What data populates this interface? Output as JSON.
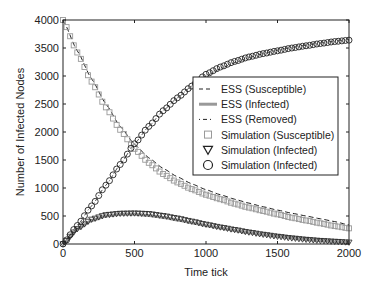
{
  "chart_data": {
    "type": "line",
    "title": "",
    "xlabel": "Time tick",
    "ylabel": "Number of Infected Nodes",
    "xlim": [
      0,
      2000
    ],
    "ylim": [
      0,
      4000
    ],
    "xticks": [
      0,
      500,
      1000,
      1500,
      2000
    ],
    "yticks": [
      0,
      500,
      1000,
      1500,
      2000,
      2500,
      3000,
      3500,
      4000
    ],
    "grid": false,
    "legend_position": "center-right",
    "x": [
      0,
      100,
      200,
      300,
      400,
      500,
      600,
      700,
      800,
      900,
      1000,
      1100,
      1200,
      1300,
      1400,
      1500,
      1600,
      1700,
      1800,
      1900,
      2000
    ],
    "series": [
      {
        "name": "ESS (Susceptible)",
        "style": "dashed",
        "color": "#222222",
        "values": [
          4000,
          3450,
          2950,
          2500,
          2100,
          1780,
          1540,
          1350,
          1200,
          1075,
          970,
          880,
          800,
          730,
          665,
          605,
          550,
          500,
          450,
          400,
          340
        ]
      },
      {
        "name": "ESS (Infected)",
        "style": "solid-thick",
        "color": "#999999",
        "values": [
          0,
          260,
          420,
          500,
          530,
          530,
          510,
          475,
          430,
          380,
          330,
          285,
          240,
          200,
          165,
          135,
          105,
          80,
          60,
          40,
          25
        ]
      },
      {
        "name": "ESS (Removed)",
        "style": "dashdot",
        "color": "#222222",
        "values": [
          0,
          330,
          680,
          1050,
          1420,
          1790,
          2100,
          2380,
          2610,
          2820,
          3000,
          3130,
          3240,
          3330,
          3400,
          3460,
          3510,
          3550,
          3590,
          3620,
          3650
        ]
      },
      {
        "name": "Simulation (Susceptible)",
        "marker": "square",
        "color": "#999999",
        "values": [
          4000,
          3420,
          2900,
          2440,
          2040,
          1700,
          1450,
          1250,
          1100,
          980,
          880,
          800,
          720,
          650,
          590,
          530,
          470,
          420,
          370,
          320,
          280
        ]
      },
      {
        "name": "Simulation (Infected)",
        "marker": "triangle-down",
        "color": "#222222",
        "values": [
          0,
          270,
          440,
          520,
          545,
          550,
          540,
          505,
          460,
          405,
          350,
          300,
          255,
          210,
          170,
          135,
          105,
          80,
          60,
          45,
          30
        ]
      },
      {
        "name": "Simulation (Infected)",
        "marker": "circle",
        "color": "#222222",
        "values": [
          0,
          330,
          680,
          1050,
          1420,
          1790,
          2100,
          2380,
          2610,
          2820,
          3030,
          3160,
          3260,
          3340,
          3400,
          3450,
          3500,
          3540,
          3580,
          3615,
          3640
        ]
      }
    ]
  }
}
